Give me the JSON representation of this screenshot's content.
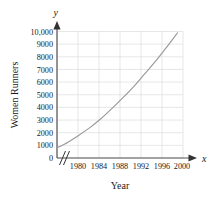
{
  "chart_data": {
    "type": "line",
    "title": "",
    "xlabel": "Year",
    "ylabel": "Women Runners",
    "x_axis_variable": "x",
    "y_axis_variable": "y",
    "xlim": [
      1978,
      2001
    ],
    "ylim": [
      0,
      10000
    ],
    "grid": true,
    "legend": "none",
    "axis_break_x": true,
    "x_tick_labels": [
      "1980",
      "1984",
      "1988",
      "1992",
      "1996",
      "2000"
    ],
    "x_tick_values": [
      1980,
      1984,
      1988,
      1992,
      1996,
      2000
    ],
    "y_tick_labels": [
      "0",
      "1000",
      "2000",
      "3000",
      "4000",
      "5000",
      "6000",
      "7000",
      "8000",
      "9000",
      "10,000"
    ],
    "y_tick_values": [
      0,
      1000,
      2000,
      3000,
      4000,
      5000,
      6000,
      7000,
      8000,
      9000,
      10000
    ],
    "series": [
      {
        "name": "Women Runners",
        "x": [
          1978,
          1980,
          1982,
          1984,
          1986,
          1988,
          1990,
          1992,
          1994,
          1996,
          1998,
          2000
        ],
        "values": [
          800,
          1250,
          1800,
          2400,
          3100,
          3900,
          4750,
          5650,
          6650,
          7650,
          8750,
          9900
        ]
      }
    ],
    "colors": {
      "curve": "#9a9a9a",
      "grid": "#dcdcdc",
      "axis": "#555555",
      "text": "#1a1a1a",
      "background": "#ffffff"
    }
  }
}
